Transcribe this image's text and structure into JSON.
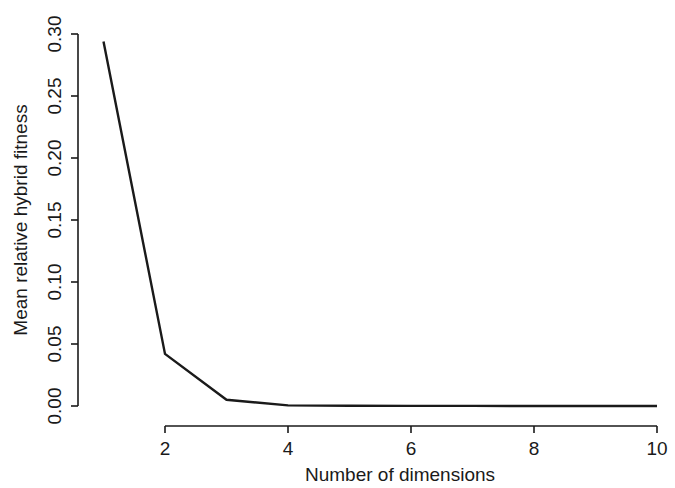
{
  "figure": {
    "background_color": "#ffffff",
    "foreground_color": "#1a1a1a",
    "caption_partial": "(averaging over all replicates)"
  },
  "chart_data": {
    "type": "line",
    "title": "",
    "xlabel": "Number of dimensions",
    "ylabel": "Mean relative hybrid fitness",
    "x": [
      1,
      2,
      3,
      4,
      5,
      6,
      7,
      8,
      9,
      10
    ],
    "values": [
      0.294,
      0.042,
      0.005,
      0.0005,
      0.0002,
      0.0001,
      0.0001,
      0.0,
      0.0,
      0.0
    ],
    "series": [
      {
        "name": "Mean relative hybrid fitness",
        "color": "#1a1a1a",
        "values": [
          0.294,
          0.042,
          0.005,
          0.0005,
          0.0002,
          0.0001,
          0.0001,
          0.0,
          0.0,
          0.0
        ]
      }
    ],
    "xlim": [
      1,
      10
    ],
    "ylim": [
      0.0,
      0.3
    ],
    "xticks": [
      2,
      4,
      6,
      8,
      10
    ],
    "xtick_labels": [
      "2",
      "4",
      "6",
      "8",
      "10"
    ],
    "yticks": [
      0.0,
      0.05,
      0.1,
      0.15,
      0.2,
      0.25,
      0.3
    ],
    "ytick_labels": [
      "0.00",
      "0.05",
      "0.10",
      "0.15",
      "0.20",
      "0.25",
      "0.30"
    ],
    "grid": false,
    "legend": false,
    "legend_position": "none",
    "line_style": "solid",
    "markers": "none",
    "axis_style": "L-shaped"
  },
  "axes": {
    "x_title": "Number of dimensions",
    "y_title": "Mean relative hybrid fitness",
    "x_tick_labels": [
      "2",
      "4",
      "6",
      "8",
      "10"
    ],
    "y_tick_labels": [
      "0.00",
      "0.05",
      "0.10",
      "0.15",
      "0.20",
      "0.25",
      "0.30"
    ]
  }
}
